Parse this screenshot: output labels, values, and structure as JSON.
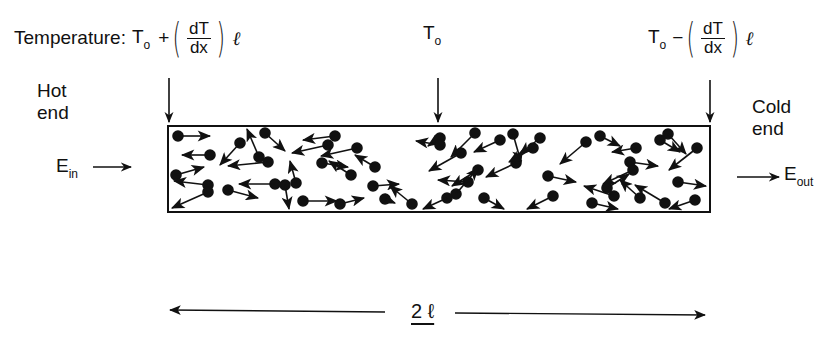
{
  "diagram": {
    "title_label": "Temperature:",
    "temperatures": {
      "hot": {
        "base": "T",
        "base_sub": "o",
        "op": "+",
        "frac_num": "dT",
        "frac_den": "dx",
        "factor": "ℓ"
      },
      "middle": {
        "base": "T",
        "base_sub": "o"
      },
      "cold": {
        "base": "T",
        "base_sub": "o",
        "op": "−",
        "frac_num": "dT",
        "frac_den": "dx",
        "factor": "ℓ"
      }
    },
    "hot_end": {
      "line1": "Hot",
      "line2": "end"
    },
    "cold_end": {
      "line1": "Cold",
      "line2": "end"
    },
    "energy_in": {
      "symbol": "E",
      "sub": "in"
    },
    "energy_out": {
      "symbol": "E",
      "sub": "out"
    },
    "length": {
      "label": "2 ℓ"
    },
    "bar": {
      "description": "rod containing randomly moving molecules (dots with velocity arrows)"
    },
    "colors": {
      "ink": "#111111",
      "background": "#ffffff"
    }
  }
}
